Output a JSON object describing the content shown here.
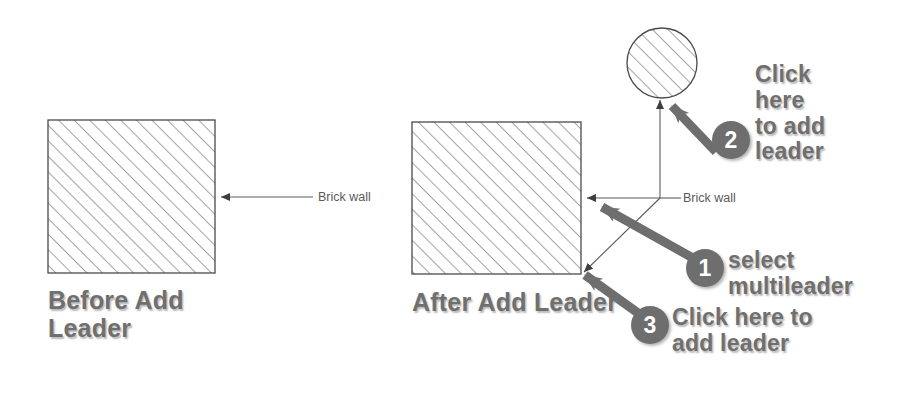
{
  "figure": {
    "background_color": "#ffffff",
    "annotation_color": "#6f6f6f",
    "badge_color": "#6e6e6e",
    "badge_text_color": "#ffffff",
    "drawing_line_color": "#4a4a4a",
    "hatch_color": "#8a8a8a"
  },
  "panels": {
    "before": {
      "caption": "Before Add\nLeader",
      "shape": "hatched-square",
      "leader_label": "Brick wall",
      "leader_count": 1
    },
    "after": {
      "caption": "After Add Leader",
      "shape": "hatched-square",
      "extra_shape": "hatched-circle",
      "leader_label": "Brick wall",
      "leader_count": 3
    }
  },
  "steps": [
    {
      "number": "1",
      "text": "select\nmultileader",
      "target": "multileader-horizontal-landing"
    },
    {
      "number": "2",
      "text": "Click\nhere\nto add\nleader",
      "target": "hatched-circle"
    },
    {
      "number": "3",
      "text": "Click here to\nadd leader",
      "target": "square-bottom-right-corner"
    }
  ]
}
